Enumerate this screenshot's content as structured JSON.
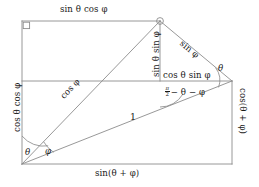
{
  "figure": {
    "stroke_color": "#8c8c8c",
    "text_color": "#1a1a1a",
    "background": "#ffffff"
  },
  "labels": {
    "top_side": "sin θ cos φ",
    "left_side": "cos θ cos φ",
    "bottom_side": "sin(θ + φ)",
    "right_side": "cos(θ + φ)",
    "inner_vertical": "sin θ sin φ",
    "inner_horizontal": "cos θ sin φ",
    "upper_right_diagonal": "sin φ",
    "main_diagonal": "cos φ",
    "hypotenuse": "1"
  },
  "angles": {
    "theta_bottom": "θ",
    "phi_bottom": "φ",
    "theta_right": "θ",
    "complement_num": "π",
    "complement_den": "2",
    "complement_rest": "− θ − φ"
  },
  "markers": {
    "right_angle": "right-angle-square",
    "apex_dot": "apex-circle"
  }
}
